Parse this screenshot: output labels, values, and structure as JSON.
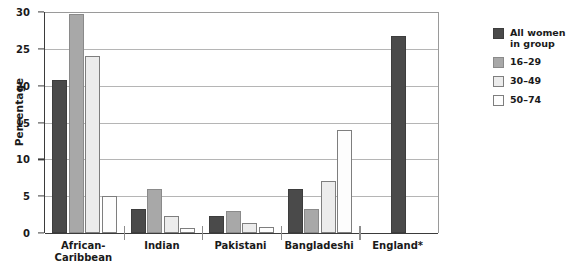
{
  "chart_data": {
    "type": "bar",
    "title": "",
    "xlabel": "",
    "ylabel": "Percentage",
    "ylim": [
      0,
      30
    ],
    "yticks": [
      0,
      5,
      10,
      15,
      20,
      25,
      30
    ],
    "ytick_labels": [
      "0",
      "5",
      "10",
      "15",
      "20",
      "25",
      "30"
    ],
    "grid": true,
    "legend_position": "right",
    "categories": [
      "African-\nCaribbean",
      "Indian",
      "Pakistani",
      "Bangladeshi",
      "England*"
    ],
    "series": [
      {
        "name": "All women\nin group",
        "color": "#4a4a4a",
        "values": [
          20.8,
          3.3,
          2.3,
          6.0,
          26.8
        ]
      },
      {
        "name": "16–29",
        "color": "#a8a8a8",
        "values": [
          29.7,
          6.0,
          3.0,
          3.3,
          null
        ]
      },
      {
        "name": "30–49",
        "color": "#ececec",
        "values": [
          24.0,
          2.3,
          1.3,
          7.0,
          null
        ]
      },
      {
        "name": "50–74",
        "color": "#fdfdfd",
        "values": [
          5.0,
          0.7,
          0.8,
          14.0,
          null
        ]
      }
    ]
  },
  "legend": {
    "entries": [
      {
        "label": "All women\nin group"
      },
      {
        "label": "16–29"
      },
      {
        "label": "30–49"
      },
      {
        "label": "50–74"
      }
    ]
  }
}
